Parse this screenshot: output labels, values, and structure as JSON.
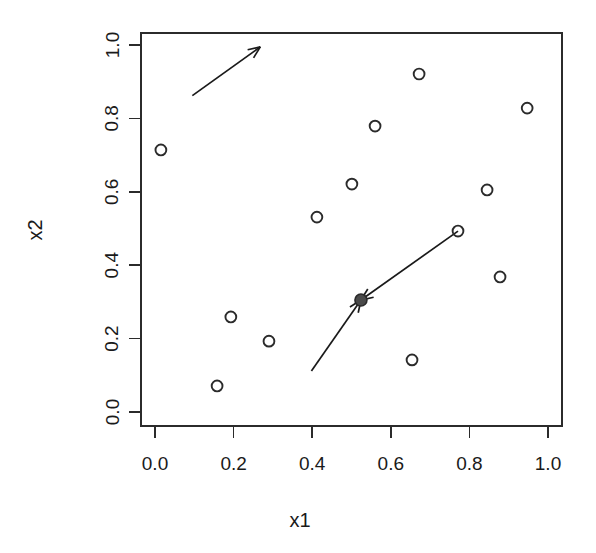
{
  "chart_data": {
    "type": "scatter",
    "title": "",
    "xlabel": "x1",
    "ylabel": "x2",
    "xlim": [
      -0.04,
      1.0
    ],
    "ylim": [
      -0.04,
      1.05
    ],
    "grid": false,
    "legend": null,
    "xticks": [
      0.0,
      0.2,
      0.4,
      0.6,
      0.8,
      1.0
    ],
    "yticks": [
      0.0,
      0.2,
      0.4,
      0.6,
      0.8,
      1.0
    ],
    "xticklabels": [
      "0.0",
      "0.2",
      "0.4",
      "0.6",
      "0.8",
      "1.0"
    ],
    "yticklabels": [
      "0.0",
      "0.2",
      "0.4",
      "0.6",
      "0.8",
      "1.0"
    ],
    "series": [
      {
        "name": "data-points",
        "marker": "open-circle",
        "color": "#2b2b2b",
        "points": [
          {
            "x": 0.015,
            "y": 0.714
          },
          {
            "x": 0.158,
            "y": 0.071
          },
          {
            "x": 0.193,
            "y": 0.259
          },
          {
            "x": 0.29,
            "y": 0.193
          },
          {
            "x": 0.412,
            "y": 0.531
          },
          {
            "x": 0.501,
            "y": 0.621
          },
          {
            "x": 0.56,
            "y": 0.779
          },
          {
            "x": 0.654,
            "y": 0.142
          },
          {
            "x": 0.672,
            "y": 0.921
          },
          {
            "x": 0.771,
            "y": 0.493
          },
          {
            "x": 0.845,
            "y": 0.605
          },
          {
            "x": 0.878,
            "y": 0.368
          },
          {
            "x": 0.947,
            "y": 0.828
          }
        ]
      },
      {
        "name": "highlighted-point",
        "marker": "filled-circle",
        "color": "#4a4a4a",
        "points": [
          {
            "x": 0.524,
            "y": 0.305
          }
        ]
      }
    ],
    "annotations": [
      {
        "name": "direction-arrow",
        "type": "arrow",
        "from": {
          "x": 0.095,
          "y": 0.862
        },
        "to": {
          "x": 0.268,
          "y": 0.995
        }
      },
      {
        "name": "vector-from-upper-right",
        "type": "arrow",
        "from": {
          "x": 0.771,
          "y": 0.493
        },
        "to": {
          "x": 0.524,
          "y": 0.305
        }
      },
      {
        "name": "vector-from-lower-left",
        "type": "arrow",
        "from": {
          "x": 0.398,
          "y": 0.112
        },
        "to": {
          "x": 0.524,
          "y": 0.305
        }
      }
    ]
  },
  "axes": {
    "x_title": "x1",
    "y_title": "x2"
  }
}
